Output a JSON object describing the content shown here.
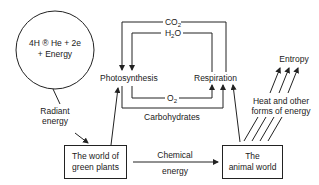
{
  "diagram": {
    "sun_reaction": {
      "line1": "4H ® He + 2e",
      "line2": "+ Energy"
    },
    "radiant_energy": {
      "line1": "Radiant",
      "line2": "energy"
    },
    "photosynthesis": "Photosynthesis",
    "respiration": "Respiration",
    "co2": {
      "main": "CO",
      "sub": "2"
    },
    "h2o": {
      "main1": "H",
      "sub": "2",
      "main2": "O"
    },
    "o2": {
      "main": "O",
      "sub": "2"
    },
    "carbohydrates": "Carbohydrates",
    "green_plants": {
      "line1": "The world of",
      "line2": "green plants"
    },
    "animal_world": {
      "line1": "The",
      "line2": "animal world"
    },
    "chemical_energy": {
      "line1": "Chemical",
      "line2": "energy"
    },
    "heat": {
      "line1": "Heat and other",
      "line2": "forms of energy"
    },
    "entropy": "Entropy",
    "colors": {
      "line": "#222222",
      "background": "#ffffff",
      "text": "#1a1a1a"
    }
  }
}
